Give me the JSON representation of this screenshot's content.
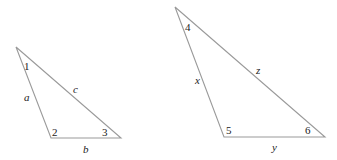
{
  "triangles": [
    {
      "name": "triangle-abc",
      "vertices": [
        [
          16,
          47
        ],
        [
          51,
          138
        ],
        [
          121,
          138
        ]
      ],
      "angles": [
        {
          "label": "1",
          "x": 24,
          "y": 70
        },
        {
          "label": "2",
          "x": 52,
          "y": 136
        },
        {
          "label": "3",
          "x": 102,
          "y": 136
        }
      ],
      "sides": [
        {
          "label": "a",
          "x": 25,
          "y": 101
        },
        {
          "label": "b",
          "x": 83,
          "y": 153
        },
        {
          "label": "c",
          "x": 73,
          "y": 93
        }
      ]
    },
    {
      "name": "triangle-xyz",
      "vertices": [
        [
          175,
          7
        ],
        [
          224,
          137
        ],
        [
          325,
          137
        ]
      ],
      "angles": [
        {
          "label": "4",
          "x": 185,
          "y": 31
        },
        {
          "label": "5",
          "x": 226,
          "y": 134
        },
        {
          "label": "6",
          "x": 305,
          "y": 134
        }
      ],
      "sides": [
        {
          "label": "x",
          "x": 195,
          "y": 84
        },
        {
          "label": "y",
          "x": 272,
          "y": 151
        },
        {
          "label": "z",
          "x": 256,
          "y": 74
        }
      ]
    }
  ],
  "labels": {
    "angle1": "1",
    "angle2": "2",
    "angle3": "3",
    "angle4": "4",
    "angle5": "5",
    "angle6": "6",
    "side_a": "a",
    "side_b": "b",
    "side_c": "c",
    "side_x": "x",
    "side_y": "y",
    "side_z": "z"
  }
}
